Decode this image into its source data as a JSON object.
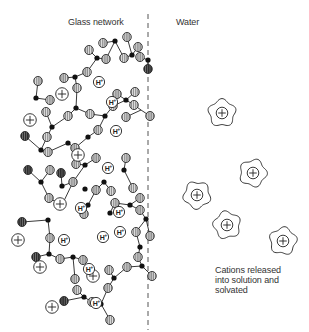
{
  "labels": {
    "glass_network": "Glass network",
    "water": "Water",
    "caption_lines": [
      "Cations released",
      "into solution and",
      "solvated"
    ]
  },
  "colors": {
    "bond": "#222222",
    "si_node": "#111111",
    "oxygen_fill": "#8a8a8a",
    "oxygen_stripe": "#e0e0e0",
    "oxygen_dark_fill": "#333333",
    "outline": "#222222",
    "divider": "#555555"
  },
  "symbols": {
    "cation": "+",
    "hydrogen_ion": "H+"
  },
  "divider": {
    "x": 148,
    "y1": 14,
    "y2": 330
  },
  "network": {
    "si_nodes": [
      [
        148,
        60
      ],
      [
        132,
        55
      ],
      [
        115,
        41
      ],
      [
        97,
        58
      ],
      [
        75,
        77
      ],
      [
        76,
        108
      ],
      [
        36,
        98
      ],
      [
        52,
        127
      ],
      [
        41,
        150
      ],
      [
        68,
        143
      ],
      [
        88,
        137
      ],
      [
        105,
        116
      ],
      [
        126,
        100
      ],
      [
        85,
        165
      ],
      [
        41,
        182
      ],
      [
        62,
        186
      ],
      [
        85,
        189
      ],
      [
        104,
        182
      ],
      [
        124,
        170
      ],
      [
        130,
        205
      ],
      [
        110,
        213
      ],
      [
        88,
        205
      ],
      [
        62,
        205
      ],
      [
        48,
        220
      ],
      [
        49,
        254
      ],
      [
        73,
        257
      ],
      [
        84,
        297
      ],
      [
        101,
        304
      ],
      [
        114,
        278
      ],
      [
        142,
        266
      ],
      [
        146,
        219
      ],
      [
        140,
        247
      ]
    ],
    "oxygens": [
      {
        "x": 148,
        "y": 69,
        "dark": true
      },
      {
        "x": 140,
        "y": 57,
        "dark": false
      },
      {
        "x": 138,
        "y": 47,
        "dark": false
      },
      {
        "x": 127,
        "y": 37,
        "dark": false
      },
      {
        "x": 124,
        "y": 58,
        "dark": false
      },
      {
        "x": 106,
        "y": 59,
        "dark": false
      },
      {
        "x": 103,
        "y": 43,
        "dark": false
      },
      {
        "x": 87,
        "y": 72,
        "dark": false
      },
      {
        "x": 89,
        "y": 50,
        "dark": false
      },
      {
        "x": 77,
        "y": 88,
        "dark": false
      },
      {
        "x": 64,
        "y": 78,
        "dark": false
      },
      {
        "x": 38,
        "y": 81,
        "dark": false
      },
      {
        "x": 50,
        "y": 100,
        "dark": false
      },
      {
        "x": 46,
        "y": 112,
        "dark": false
      },
      {
        "x": 25,
        "y": 136,
        "dark": true
      },
      {
        "x": 47,
        "y": 137,
        "dark": false
      },
      {
        "x": 48,
        "y": 152,
        "dark": false
      },
      {
        "x": 68,
        "y": 116,
        "dark": false
      },
      {
        "x": 90,
        "y": 114,
        "dark": false
      },
      {
        "x": 98,
        "y": 130,
        "dark": false
      },
      {
        "x": 75,
        "y": 148,
        "dark": false
      },
      {
        "x": 76,
        "y": 164,
        "dark": false
      },
      {
        "x": 96,
        "y": 158,
        "dark": false
      },
      {
        "x": 117,
        "y": 94,
        "dark": false
      },
      {
        "x": 113,
        "y": 106,
        "dark": false
      },
      {
        "x": 135,
        "y": 92,
        "dark": false
      },
      {
        "x": 134,
        "y": 105,
        "dark": false
      },
      {
        "x": 126,
        "y": 117,
        "dark": false
      },
      {
        "x": 150,
        "y": 116,
        "dark": false
      },
      {
        "x": 28,
        "y": 170,
        "dark": true
      },
      {
        "x": 50,
        "y": 170,
        "dark": false
      },
      {
        "x": 49,
        "y": 198,
        "dark": false
      },
      {
        "x": 61,
        "y": 173,
        "dark": true
      },
      {
        "x": 73,
        "y": 182,
        "dark": false
      },
      {
        "x": 96,
        "y": 190,
        "dark": false
      },
      {
        "x": 111,
        "y": 191,
        "dark": false
      },
      {
        "x": 115,
        "y": 203,
        "dark": false
      },
      {
        "x": 133,
        "y": 188,
        "dark": false
      },
      {
        "x": 126,
        "y": 158,
        "dark": false
      },
      {
        "x": 140,
        "y": 198,
        "dark": false
      },
      {
        "x": 84,
        "y": 214,
        "dark": false
      },
      {
        "x": 22,
        "y": 222,
        "dark": true
      },
      {
        "x": 50,
        "y": 238,
        "dark": false
      },
      {
        "x": 36,
        "y": 257,
        "dark": true
      },
      {
        "x": 60,
        "y": 259,
        "dark": false
      },
      {
        "x": 83,
        "y": 260,
        "dark": false
      },
      {
        "x": 75,
        "y": 279,
        "dark": false
      },
      {
        "x": 77,
        "y": 290,
        "dark": false
      },
      {
        "x": 64,
        "y": 301,
        "dark": true
      },
      {
        "x": 92,
        "y": 302,
        "dark": false
      },
      {
        "x": 110,
        "y": 320,
        "dark": false
      },
      {
        "x": 109,
        "y": 270,
        "dark": false
      },
      {
        "x": 108,
        "y": 288,
        "dark": false
      },
      {
        "x": 127,
        "y": 267,
        "dark": false
      },
      {
        "x": 136,
        "y": 232,
        "dark": false
      },
      {
        "x": 150,
        "y": 236,
        "dark": false
      },
      {
        "x": 138,
        "y": 257,
        "dark": false
      },
      {
        "x": 152,
        "y": 276,
        "dark": false
      },
      {
        "x": 140,
        "y": 210,
        "dark": false
      }
    ],
    "bonds": [
      [
        148,
        60,
        148,
        69
      ],
      [
        148,
        60,
        140,
        57
      ],
      [
        132,
        55,
        138,
        47
      ],
      [
        132,
        55,
        124,
        58
      ],
      [
        132,
        55,
        127,
        37
      ],
      [
        115,
        41,
        124,
        58
      ],
      [
        115,
        41,
        103,
        43
      ],
      [
        115,
        41,
        106,
        59
      ],
      [
        97,
        58,
        106,
        59
      ],
      [
        97,
        58,
        89,
        50
      ],
      [
        97,
        58,
        87,
        72
      ],
      [
        75,
        77,
        87,
        72
      ],
      [
        75,
        77,
        64,
        78
      ],
      [
        75,
        77,
        77,
        88
      ],
      [
        76,
        108,
        77,
        88
      ],
      [
        76,
        108,
        68,
        116
      ],
      [
        76,
        108,
        90,
        114
      ],
      [
        36,
        98,
        38,
        81
      ],
      [
        36,
        98,
        50,
        100
      ],
      [
        52,
        127,
        46,
        112
      ],
      [
        52,
        127,
        47,
        137
      ],
      [
        52,
        127,
        68,
        116
      ],
      [
        41,
        150,
        47,
        137
      ],
      [
        41,
        150,
        25,
        136
      ],
      [
        41,
        150,
        48,
        152
      ],
      [
        68,
        143,
        75,
        148
      ],
      [
        68,
        143,
        48,
        152
      ],
      [
        88,
        137,
        98,
        130
      ],
      [
        88,
        137,
        75,
        148
      ],
      [
        105,
        116,
        98,
        130
      ],
      [
        105,
        116,
        113,
        106
      ],
      [
        105,
        116,
        90,
        114
      ],
      [
        126,
        100,
        113,
        106
      ],
      [
        126,
        100,
        117,
        94
      ],
      [
        126,
        100,
        135,
        92
      ],
      [
        126,
        100,
        134,
        105
      ],
      [
        141,
        110,
        134,
        105
      ],
      [
        141,
        110,
        150,
        116
      ],
      [
        141,
        110,
        126,
        117
      ],
      [
        85,
        165,
        76,
        164
      ],
      [
        85,
        165,
        96,
        158
      ],
      [
        85,
        165,
        73,
        182
      ],
      [
        41,
        182,
        28,
        170
      ],
      [
        41,
        182,
        50,
        170
      ],
      [
        41,
        182,
        49,
        198
      ],
      [
        62,
        186,
        73,
        182
      ],
      [
        62,
        186,
        61,
        173
      ],
      [
        104,
        182,
        96,
        190
      ],
      [
        104,
        182,
        111,
        191
      ],
      [
        124,
        170,
        126,
        158
      ],
      [
        124,
        170,
        133,
        188
      ],
      [
        130,
        205,
        140,
        198
      ],
      [
        130,
        205,
        115,
        203
      ],
      [
        130,
        205,
        140,
        210
      ],
      [
        110,
        213,
        115,
        203
      ],
      [
        88,
        205,
        96,
        190
      ],
      [
        88,
        205,
        84,
        214
      ],
      [
        62,
        205,
        49,
        198
      ],
      [
        62,
        205,
        73,
        182
      ],
      [
        48,
        220,
        22,
        222
      ],
      [
        48,
        220,
        50,
        238
      ],
      [
        49,
        254,
        50,
        238
      ],
      [
        49,
        254,
        36,
        257
      ],
      [
        49,
        254,
        60,
        259
      ],
      [
        73,
        257,
        60,
        259
      ],
      [
        73,
        257,
        83,
        260
      ],
      [
        73,
        257,
        75,
        279
      ],
      [
        84,
        297,
        77,
        290
      ],
      [
        84,
        297,
        64,
        301
      ],
      [
        84,
        297,
        92,
        302
      ],
      [
        101,
        304,
        92,
        302
      ],
      [
        101,
        304,
        110,
        320
      ],
      [
        101,
        304,
        108,
        288
      ],
      [
        114,
        278,
        109,
        270
      ],
      [
        114,
        278,
        108,
        288
      ],
      [
        114,
        278,
        127,
        267
      ],
      [
        142,
        266,
        127,
        267
      ],
      [
        142,
        266,
        138,
        257
      ],
      [
        142,
        266,
        152,
        276
      ],
      [
        146,
        219,
        140,
        210
      ],
      [
        146,
        219,
        136,
        232
      ],
      [
        146,
        219,
        150,
        236
      ],
      [
        140,
        247,
        136,
        232
      ],
      [
        140,
        247,
        138,
        257
      ]
    ],
    "cations": [
      [
        62,
        94
      ],
      [
        30,
        120
      ],
      [
        78,
        155
      ],
      [
        60,
        204
      ],
      [
        40,
        267
      ],
      [
        18,
        240
      ],
      [
        52,
        307
      ],
      [
        93,
        276
      ]
    ],
    "hydrogen_ions": [
      [
        99,
        82
      ],
      [
        112,
        102
      ],
      [
        116,
        131
      ],
      [
        108,
        168
      ],
      [
        81,
        208
      ],
      [
        64,
        240
      ],
      [
        119,
        212
      ],
      [
        89,
        269
      ],
      [
        103,
        237
      ],
      [
        96,
        303
      ],
      [
        120,
        232
      ]
    ]
  },
  "solvated_cations": [
    [
      222,
      113
    ],
    [
      253,
      173
    ],
    [
      197,
      195
    ],
    [
      227,
      225
    ],
    [
      283,
      241
    ]
  ]
}
